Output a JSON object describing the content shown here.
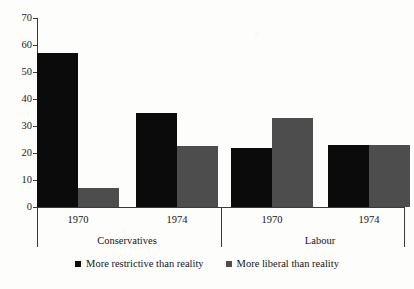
{
  "chart_data": {
    "type": "bar",
    "title": "",
    "subtitle": "",
    "xlabel": "",
    "ylabel": "",
    "ylim": [
      0,
      70
    ],
    "yticks": [
      0,
      10,
      20,
      30,
      40,
      50,
      60,
      70
    ],
    "grid": false,
    "legend_position": "bottom",
    "categories": [
      "1970",
      "1974",
      "1970",
      "1974"
    ],
    "groups": [
      {
        "name": "Conservatives",
        "categories": [
          "1970",
          "1974"
        ]
      },
      {
        "name": "Labour",
        "categories": [
          "1970",
          "1974"
        ]
      }
    ],
    "series": [
      {
        "name": "More restrictive than reality",
        "color": "#0b0b0b",
        "values": [
          57,
          35,
          22,
          23
        ]
      },
      {
        "name": "More liberal than reality",
        "color": "#4d4d4d",
        "values": [
          7,
          22.5,
          33,
          23
        ]
      }
    ]
  },
  "axes": {
    "y": {
      "ticks": [
        "70",
        "60",
        "50",
        "40",
        "30",
        "20",
        "10",
        "0"
      ],
      "min": 0,
      "max": 70
    },
    "x": {
      "tick_labels": [
        "1970",
        "1974",
        "1970",
        "1974"
      ],
      "group_labels": [
        "Conservatives",
        "Labour"
      ]
    }
  },
  "legend": {
    "items": [
      {
        "label": "More restrictive than reality",
        "color": "#0b0b0b"
      },
      {
        "label": "More liberal than reality",
        "color": "#4d4d4d"
      }
    ]
  },
  "colors": {
    "series_restrictive": "#0b0b0b",
    "series_liberal": "#4d4d4d",
    "axis": "#3a3a3a",
    "background": "#fdfdfb"
  }
}
